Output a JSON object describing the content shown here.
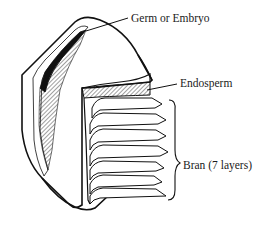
{
  "diagram": {
    "labels": {
      "germ": "Germ or Embryo",
      "endosperm": "Endosperm",
      "bran": "Bran (7 layers)"
    },
    "bran_layer_count": 7,
    "colors": {
      "stroke": "#111111",
      "background": "#ffffff",
      "germ_fill": "#111111"
    }
  }
}
